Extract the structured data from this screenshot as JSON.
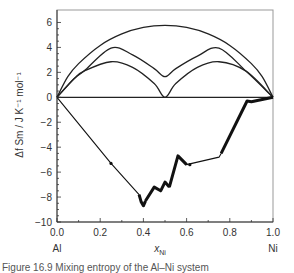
{
  "chart_data": {
    "type": "line",
    "title": "",
    "xlabel": "x_Ni",
    "xlabel_main": "x",
    "xlabel_sub": "Ni",
    "ylabel": "Δf Sm / J K⁻¹ mol⁻¹",
    "xlim": [
      0.0,
      1.0
    ],
    "ylim": [
      -10,
      7
    ],
    "x_ticks": [
      "0.0",
      "0.2",
      "0.4",
      "0.6",
      "0.8",
      "1.0"
    ],
    "y_ticks": [
      "6",
      "4",
      "2",
      "0",
      "−2",
      "−4",
      "−6",
      "−8",
      "−10"
    ],
    "x_end_labels": {
      "left": "Al",
      "right": "Ni"
    },
    "grid": false,
    "series": [
      {
        "name": "ideal mixing entropy (random)",
        "x": [
          0.0,
          0.05,
          0.1,
          0.2,
          0.3,
          0.4,
          0.5,
          0.6,
          0.7,
          0.8,
          0.9,
          0.95,
          1.0
        ],
        "values": [
          0.0,
          1.65,
          2.7,
          4.16,
          5.08,
          5.6,
          5.76,
          5.6,
          5.08,
          4.16,
          2.7,
          1.65,
          0.0
        ]
      },
      {
        "name": "upper ordered branch",
        "x": [
          0.0,
          0.08,
          0.125,
          0.25,
          0.35,
          0.45,
          0.5,
          0.55,
          0.65,
          0.75,
          0.875,
          1.0
        ],
        "values": [
          0.0,
          1.5,
          2.1,
          3.95,
          3.4,
          2.3,
          1.65,
          2.3,
          3.3,
          3.95,
          2.1,
          0.0
        ]
      },
      {
        "name": "lower ordered branch",
        "x": [
          0.0,
          0.08,
          0.125,
          0.25,
          0.35,
          0.45,
          0.5,
          0.55,
          0.65,
          0.75,
          0.875,
          1.0
        ],
        "values": [
          0.0,
          1.5,
          2.1,
          2.85,
          2.4,
          1.1,
          0.0,
          1.1,
          2.4,
          2.85,
          2.1,
          0.0
        ]
      },
      {
        "name": "experimental",
        "x": [
          0.0,
          0.25,
          0.38,
          0.39,
          0.4,
          0.41,
          0.45,
          0.48,
          0.5,
          0.52,
          0.56,
          0.6,
          0.75,
          0.76,
          0.88,
          0.9,
          1.0
        ],
        "values": [
          0.0,
          -5.3,
          -7.8,
          -8.4,
          -8.7,
          -8.3,
          -7.2,
          -7.5,
          -6.8,
          -7.2,
          -4.7,
          -5.4,
          -4.8,
          -4.5,
          -0.3,
          -0.35,
          0.0
        ]
      }
    ]
  },
  "caption": "Figure 16.9   Mixing entropy of the Al–Ni system"
}
